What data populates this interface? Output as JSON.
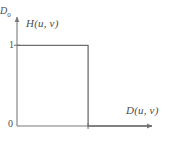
{
  "figure": {
    "name": "ideal-lowpass-filter-transfer-function",
    "background_color": "#ffffff",
    "line_color": "#7a7a7a",
    "text_color": "#4d4d4d"
  },
  "labels": {
    "y_axis": "H(u, v)",
    "x_axis": "D(u, v)",
    "origin": "0",
    "y_tick_one": "1",
    "x_tick_d0_base": "D",
    "x_tick_d0_sub": "0"
  },
  "chart_data": {
    "type": "line",
    "title": "",
    "subtitle": "",
    "xlabel": "D(u, v)",
    "ylabel": "H(u, v)",
    "xlim": [
      0,
      1.9
    ],
    "ylim": [
      0,
      1.35
    ],
    "grid": false,
    "legend_position": "none",
    "xticks": [
      0,
      1
    ],
    "xticklabels": [
      "0",
      "D0"
    ],
    "yticks": [
      0,
      1
    ],
    "yticklabels": [
      "0",
      "1"
    ],
    "cutoff": 1,
    "series": [
      {
        "name": "H(u, v)",
        "description": "Ideal lowpass filter transfer function: H = 1 for D(u,v) <= D0, H = 0 for D(u,v) > D0",
        "x": [
          0,
          1,
          1,
          1.9
        ],
        "values": [
          1,
          1,
          0,
          0
        ]
      }
    ],
    "annotations": [
      {
        "text": "H(u, v)",
        "role": "y-axis-label"
      },
      {
        "text": "D(u, v)",
        "role": "x-axis-label"
      },
      {
        "text": "1",
        "role": "y-tick"
      },
      {
        "text": "0",
        "role": "origin"
      },
      {
        "text": "D0",
        "role": "x-tick-cutoff"
      }
    ]
  }
}
